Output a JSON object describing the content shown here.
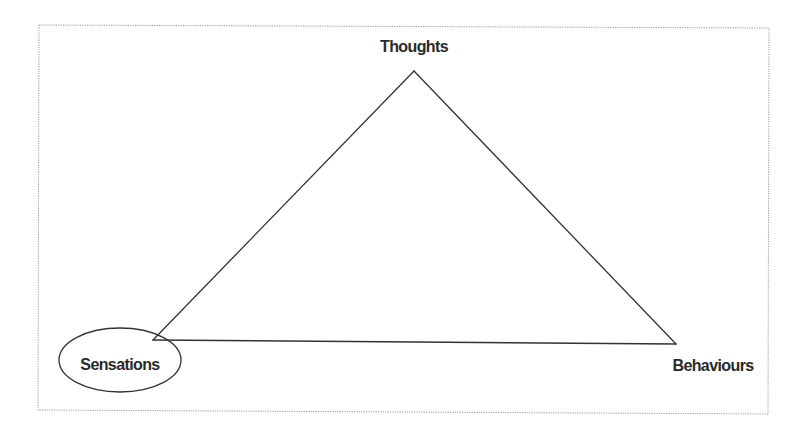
{
  "diagram": {
    "type": "triangle-model",
    "nodes": [
      {
        "id": "thoughts",
        "label": "Thoughts",
        "position": "top",
        "highlighted": false
      },
      {
        "id": "sensations",
        "label": "Sensations",
        "position": "bottom-left",
        "highlighted": true
      },
      {
        "id": "behaviours",
        "label": "Behaviours",
        "position": "bottom-right",
        "highlighted": false
      }
    ],
    "edges": [
      {
        "from": "thoughts",
        "to": "sensations"
      },
      {
        "from": "thoughts",
        "to": "behaviours"
      },
      {
        "from": "sensations",
        "to": "behaviours"
      }
    ],
    "highlight_shape": "ellipse",
    "colors": {
      "line": "#333333",
      "text": "#2a2a2a",
      "frame": "#9a9a9a",
      "background": "#ffffff"
    }
  }
}
